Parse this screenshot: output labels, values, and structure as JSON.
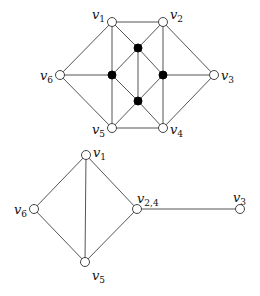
{
  "figure": {
    "top_graph": {
      "name": "original graph",
      "nodes": [
        {
          "id": "v1",
          "label": "v",
          "sub": "1",
          "x": 112,
          "y": 22,
          "type": "open",
          "lx": 92,
          "ly": 19
        },
        {
          "id": "v2",
          "label": "v",
          "sub": "2",
          "x": 163,
          "y": 22,
          "type": "open",
          "lx": 170,
          "ly": 19
        },
        {
          "id": "v3",
          "label": "v",
          "sub": "3",
          "x": 214,
          "y": 75,
          "type": "open",
          "lx": 221,
          "ly": 80
        },
        {
          "id": "v4",
          "label": "v",
          "sub": "4",
          "x": 163,
          "y": 128,
          "type": "open",
          "lx": 170,
          "ly": 134
        },
        {
          "id": "v5",
          "label": "v",
          "sub": "5",
          "x": 112,
          "y": 128,
          "type": "open",
          "lx": 92,
          "ly": 134
        },
        {
          "id": "v6",
          "label": "v",
          "sub": "6",
          "x": 60,
          "y": 75,
          "type": "open",
          "lx": 40,
          "ly": 80
        },
        {
          "id": "bT",
          "label": "",
          "sub": "",
          "x": 138,
          "y": 48,
          "type": "filled"
        },
        {
          "id": "bL",
          "label": "",
          "sub": "",
          "x": 112,
          "y": 75,
          "type": "filled"
        },
        {
          "id": "bR",
          "label": "",
          "sub": "",
          "x": 163,
          "y": 75,
          "type": "filled"
        },
        {
          "id": "bB",
          "label": "",
          "sub": "",
          "x": 138,
          "y": 101,
          "type": "filled"
        }
      ],
      "edges": [
        [
          "v1",
          "v2"
        ],
        [
          "v1",
          "v6"
        ],
        [
          "v1",
          "bL"
        ],
        [
          "bL",
          "v5"
        ],
        [
          "v1",
          "bT"
        ],
        [
          "v2",
          "bT"
        ],
        [
          "v2",
          "v3"
        ],
        [
          "v2",
          "bR"
        ],
        [
          "bR",
          "v4"
        ],
        [
          "v6",
          "bL"
        ],
        [
          "v6",
          "v5"
        ],
        [
          "bL",
          "bT"
        ],
        [
          "bL",
          "bB"
        ],
        [
          "bT",
          "bB"
        ],
        [
          "bT",
          "bR"
        ],
        [
          "bR",
          "bB"
        ],
        [
          "bR",
          "v3"
        ],
        [
          "v3",
          "v4"
        ],
        [
          "bB",
          "v5"
        ],
        [
          "bB",
          "v4"
        ],
        [
          "v5",
          "v4"
        ]
      ]
    },
    "bottom_graph": {
      "name": "contracted graph",
      "nodes": [
        {
          "id": "v1",
          "label": "v",
          "sub": "1",
          "x": 86,
          "y": 155,
          "type": "open",
          "lx": 93,
          "ly": 157
        },
        {
          "id": "v6",
          "label": "v",
          "sub": "6",
          "x": 34,
          "y": 209,
          "type": "open",
          "lx": 14,
          "ly": 214
        },
        {
          "id": "v24",
          "label": "v",
          "sub": "2,4",
          "x": 137,
          "y": 209,
          "type": "open",
          "lx": 137,
          "ly": 203
        },
        {
          "id": "v3",
          "label": "v",
          "sub": "3",
          "x": 240,
          "y": 209,
          "type": "open",
          "lx": 233,
          "ly": 202
        },
        {
          "id": "v5",
          "label": "v",
          "sub": "5",
          "x": 85,
          "y": 262,
          "type": "open",
          "lx": 92,
          "ly": 280
        }
      ],
      "edges": [
        [
          "v1",
          "v6"
        ],
        [
          "v1",
          "v5"
        ],
        [
          "v1",
          "v24"
        ],
        [
          "v6",
          "v5"
        ],
        [
          "v5",
          "v24"
        ],
        [
          "v24",
          "v3"
        ]
      ]
    }
  }
}
